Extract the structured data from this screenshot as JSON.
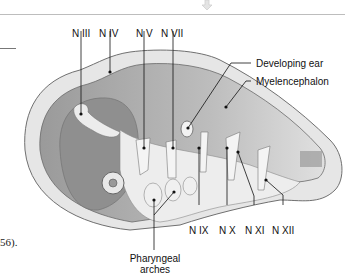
{
  "diagram": {
    "colors": {
      "tissue_dark": "#8a8a8a",
      "tissue_mid": "#b4b4b4",
      "tissue_light": "#dcdcdc",
      "outline": "#6a6a6a",
      "label": "#111111"
    },
    "labels": {
      "n3": "N III",
      "n4": "N IV",
      "n5": "N V",
      "n7": "N VII",
      "ear": "Developing ear",
      "myel": "Myelencephalon",
      "n9": "N IX",
      "n10": "N X",
      "n11": "N XI",
      "n12": "N XII",
      "pharyngeal_line1": "Pharyngeal",
      "pharyngeal_line2": "arches"
    },
    "partial_text": "56)."
  }
}
